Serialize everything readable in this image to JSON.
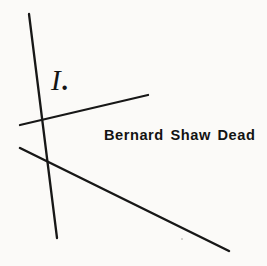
{
  "figure": {
    "background_color": "#fbfaf8",
    "ink_color": "#171717",
    "width": 267,
    "height": 266,
    "roman_numeral_label": "I",
    "roman_numeral_period": ".",
    "headline_text": "Bernard Shaw Dead",
    "lines": [
      {
        "name": "steep-descending-line",
        "x1": 29,
        "y1": 14,
        "x2": 57,
        "y2": 238,
        "width": 2.3
      },
      {
        "name": "ascending-right-line",
        "x1": 20,
        "y1": 125,
        "x2": 148,
        "y2": 95,
        "width": 2.3
      },
      {
        "name": "descending-right-line",
        "x1": 20,
        "y1": 148,
        "x2": 229,
        "y2": 251,
        "width": 2.5
      }
    ],
    "intersection": {
      "x": 45,
      "y": 137
    },
    "speck": {
      "x": 181,
      "y": 238
    }
  }
}
